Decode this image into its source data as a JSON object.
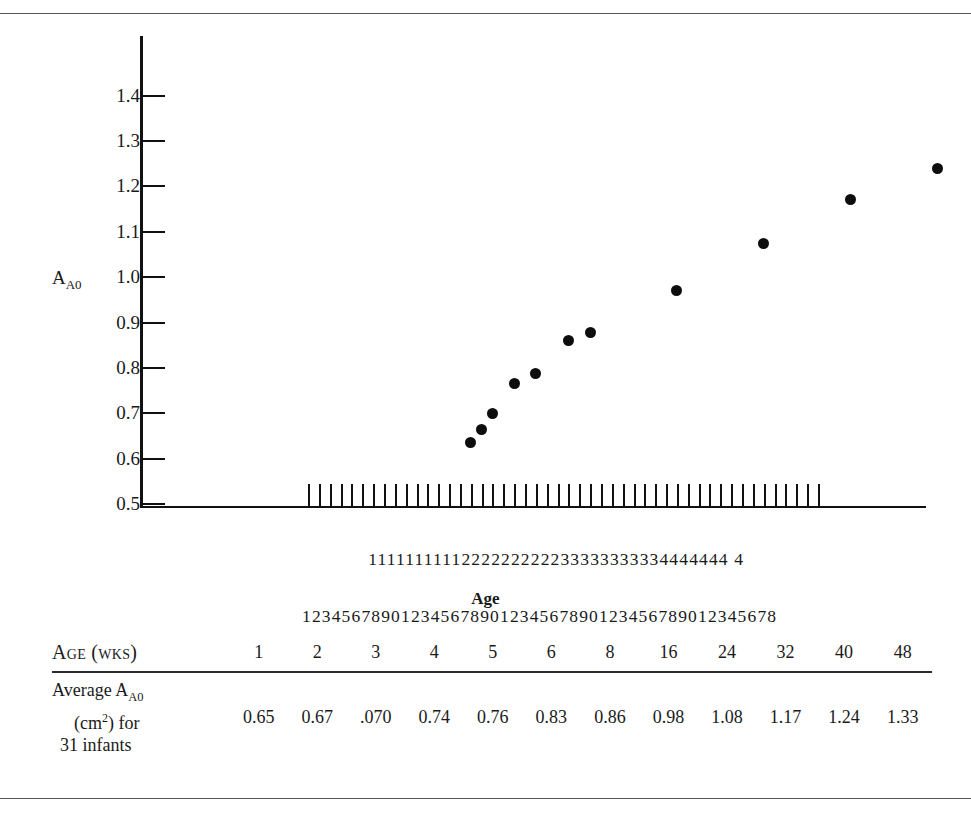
{
  "figure": {
    "y_axis_title_main": "A",
    "y_axis_title_sub": "A0",
    "x_axis_title": "Age",
    "y_ticks": [
      "1.4",
      "1.3",
      "1.2",
      "1.1",
      "1.0",
      "0.9",
      "0.8",
      "0.7",
      "0.6",
      "0.5"
    ],
    "x_tick_digits_row1": "            1111111111222222222233333333334444444 4",
    "x_tick_digits_row2": "123456789012345678901234567890123456789012345678",
    "dot_color": "#0d0d0d",
    "axis_color": "#111111"
  },
  "table": {
    "header_label": "Age (wks)",
    "row_label_line1_main": "Average A",
    "row_label_line1_sub": "A0",
    "row_label_line2": "(cm2) for",
    "row_label_line3": "31 infants",
    "ages": [
      "1",
      "2",
      "3",
      "4",
      "5",
      "6",
      "8",
      "16",
      "24",
      "32",
      "40",
      "48"
    ],
    "values": [
      "0.65",
      "0.67",
      ".070",
      "0.74",
      "0.76",
      "0.83",
      "0.86",
      "0.98",
      "1.08",
      "1.17",
      "1.24",
      "1.33"
    ]
  },
  "chart_data": {
    "type": "scatter",
    "title": "",
    "xlabel": "Age",
    "ylabel": "A_A0",
    "ylim": [
      0.5,
      1.45
    ],
    "xlim": [
      1,
      48
    ],
    "grid": false,
    "legend": "none",
    "x_tick_labels": [
      1,
      2,
      3,
      4,
      5,
      6,
      7,
      8,
      9,
      10,
      11,
      12,
      13,
      14,
      15,
      16,
      17,
      18,
      19,
      20,
      21,
      22,
      23,
      24,
      25,
      26,
      27,
      28,
      29,
      30,
      31,
      32,
      33,
      34,
      35,
      36,
      37,
      38,
      39,
      40,
      41,
      42,
      43,
      44,
      45,
      46,
      47,
      48
    ],
    "y_tick_labels": [
      1.4,
      1.3,
      1.2,
      1.1,
      1.0,
      0.9,
      0.8,
      0.7,
      0.6,
      0.5
    ],
    "points": [
      {
        "x": 16,
        "y": 0.635
      },
      {
        "x": 17,
        "y": 0.665
      },
      {
        "x": 18,
        "y": 0.7
      },
      {
        "x": 20,
        "y": 0.765
      },
      {
        "x": 22,
        "y": 0.787
      },
      {
        "x": 25,
        "y": 0.86
      },
      {
        "x": 27,
        "y": 0.877
      },
      {
        "x": 35,
        "y": 0.97
      },
      {
        "x": 43,
        "y": 1.075
      },
      {
        "x": 51,
        "y": 1.17
      },
      {
        "x": 59,
        "y": 1.24
      },
      {
        "x": 67,
        "y": 1.38
      }
    ],
    "table_series": {
      "name": "Average A_A0 (cm2) for 31 infants",
      "x": [
        1,
        2,
        3,
        4,
        5,
        6,
        8,
        16,
        24,
        32,
        40,
        48
      ],
      "x_label": "Age (wks)",
      "values": [
        0.65,
        0.67,
        0.07,
        0.74,
        0.76,
        0.83,
        0.86,
        0.98,
        1.08,
        1.17,
        1.24,
        1.33
      ]
    }
  }
}
